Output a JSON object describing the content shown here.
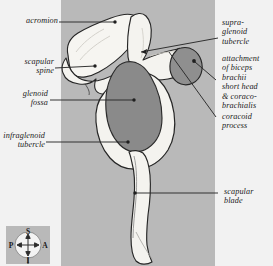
{
  "figure": {
    "panel_color": "#b9b9b9",
    "page_background": "#f2f2f2",
    "bone_fill": "#f4f3ef",
    "glenoid_fossa_color": "#8a8a8a",
    "coracoid_color": "#8f8f8f",
    "outline_color": "#262626",
    "leader_color": "#2a2a2a"
  },
  "labels": {
    "acromion": "acromion",
    "scapular_spine": "scapular\nspine",
    "scapular_spine_line1": "scapular",
    "scapular_spine_line2": "spine",
    "glenoid_fossa_line1": "glenoid",
    "glenoid_fossa_line2": "fossa",
    "infraglenoid_line1": "infraglenoid",
    "infraglenoid_line2": "tubercle",
    "supraglenoid_line1": "supra-",
    "supraglenoid_line2": "glenoid",
    "supraglenoid_line3": "tubercle",
    "attachment_line1": "attachment",
    "attachment_line2": "of biceps",
    "attachment_line3": "brachii",
    "attachment_line4": "short head",
    "attachment_line5": "& coraco-",
    "attachment_line6": "brachialis",
    "coracoid_line1": "coracoid",
    "coracoid_line2": "process",
    "scapular_blade_line1": "scapular",
    "scapular_blade_line2": "blade"
  },
  "compass": {
    "superior": "S",
    "inferior": "I",
    "posterior": "P",
    "anterior": "A",
    "background": "#b9b9b9",
    "disc": "#f3f3f3"
  }
}
